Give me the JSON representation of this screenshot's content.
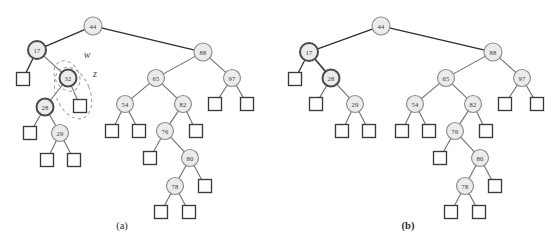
{
  "figure": {
    "background_color": "#ffffff",
    "node_fill": "#eceaea",
    "node_stroke": "#8d8d8d",
    "node_stroke_highlight": "#4a4a4a",
    "leaf_stroke": "#3a3a3a",
    "edge_color": "#6f6f6f",
    "annotation_color": "#9a9a9a"
  },
  "panels": [
    {
      "id": "panel-a",
      "caption": "(a)",
      "caption_bold": false,
      "caption_pos": {
        "x": 122,
        "y": 225
      },
      "origin": {
        "x": 0,
        "y": 0
      },
      "nodes": [
        {
          "id": "a44",
          "label": "44",
          "x": 93,
          "y": 26,
          "r": 9,
          "style": "normal"
        },
        {
          "id": "a17",
          "label": "17",
          "x": 37,
          "y": 50,
          "r": 9,
          "style": "bold"
        },
        {
          "id": "a88",
          "label": "88",
          "x": 203,
          "y": 52,
          "r": 9,
          "style": "normal"
        },
        {
          "id": "a32",
          "label": "32",
          "x": 68,
          "y": 78,
          "r": 8.5,
          "style": "bold"
        },
        {
          "id": "a65",
          "label": "65",
          "x": 156,
          "y": 78,
          "r": 8.5,
          "style": "normal"
        },
        {
          "id": "a97",
          "label": "97",
          "x": 232,
          "y": 78,
          "r": 8.5,
          "style": "normal"
        },
        {
          "id": "a28",
          "label": "28",
          "x": 45,
          "y": 107,
          "r": 8.5,
          "style": "bold"
        },
        {
          "id": "a54",
          "label": "54",
          "x": 125,
          "y": 104,
          "r": 8.5,
          "style": "normal"
        },
        {
          "id": "a82",
          "label": "82",
          "x": 183,
          "y": 104,
          "r": 8.5,
          "style": "normal"
        },
        {
          "id": "a29",
          "label": "29",
          "x": 60,
          "y": 133,
          "r": 8.5,
          "style": "normal"
        },
        {
          "id": "a76",
          "label": "76",
          "x": 165,
          "y": 131,
          "r": 8.5,
          "style": "normal"
        },
        {
          "id": "a80",
          "label": "80",
          "x": 190,
          "y": 158,
          "r": 8.5,
          "style": "normal"
        },
        {
          "id": "a78",
          "label": "78",
          "x": 175,
          "y": 186,
          "r": 8.5,
          "style": "normal"
        }
      ],
      "leaves": [
        {
          "id": "aL1",
          "x": 23,
          "y": 79,
          "s": 13,
          "parent": "a17"
        },
        {
          "id": "aL2",
          "x": 80,
          "y": 106,
          "s": 13,
          "parent": "a32"
        },
        {
          "id": "aL3",
          "x": 215,
          "y": 104,
          "s": 13,
          "parent": "a97"
        },
        {
          "id": "aL4",
          "x": 247,
          "y": 104,
          "s": 13,
          "parent": "a97"
        },
        {
          "id": "aL5",
          "x": 30,
          "y": 133,
          "s": 13,
          "parent": "a28"
        },
        {
          "id": "aL6",
          "x": 112,
          "y": 131,
          "s": 13,
          "parent": "a54"
        },
        {
          "id": "aL7",
          "x": 139,
          "y": 131,
          "s": 13,
          "parent": "a54"
        },
        {
          "id": "aL8",
          "x": 196,
          "y": 131,
          "s": 13,
          "parent": "a82"
        },
        {
          "id": "aL9",
          "x": 47,
          "y": 160,
          "s": 13,
          "parent": "a29"
        },
        {
          "id": "aL10",
          "x": 74,
          "y": 160,
          "s": 13,
          "parent": "a29"
        },
        {
          "id": "aL11",
          "x": 150,
          "y": 158,
          "s": 13,
          "parent": "a76"
        },
        {
          "id": "aL12",
          "x": 205,
          "y": 186,
          "s": 13,
          "parent": "a80"
        },
        {
          "id": "aL13",
          "x": 161,
          "y": 212,
          "s": 13,
          "parent": "a78"
        },
        {
          "id": "aL14",
          "x": 189,
          "y": 212,
          "s": 13,
          "parent": "a78"
        }
      ],
      "edges": [
        {
          "from": "a44",
          "to": "a17",
          "style": "dark"
        },
        {
          "from": "a44",
          "to": "a88",
          "style": "dark"
        },
        {
          "from": "a17",
          "to": "aL1",
          "style": "dark"
        },
        {
          "from": "a17",
          "to": "a32",
          "style": "normal"
        },
        {
          "from": "a32",
          "to": "a28",
          "style": "normal"
        },
        {
          "from": "a32",
          "to": "aL2",
          "style": "normal"
        },
        {
          "from": "a28",
          "to": "aL5",
          "style": "normal"
        },
        {
          "from": "a28",
          "to": "a29",
          "style": "normal"
        },
        {
          "from": "a29",
          "to": "aL9",
          "style": "normal"
        },
        {
          "from": "a29",
          "to": "aL10",
          "style": "normal"
        },
        {
          "from": "a88",
          "to": "a65",
          "style": "normal"
        },
        {
          "from": "a88",
          "to": "a97",
          "style": "normal"
        },
        {
          "from": "a97",
          "to": "aL3",
          "style": "normal"
        },
        {
          "from": "a97",
          "to": "aL4",
          "style": "normal"
        },
        {
          "from": "a65",
          "to": "a54",
          "style": "normal"
        },
        {
          "from": "a65",
          "to": "a82",
          "style": "normal"
        },
        {
          "from": "a54",
          "to": "aL6",
          "style": "normal"
        },
        {
          "from": "a54",
          "to": "aL7",
          "style": "normal"
        },
        {
          "from": "a82",
          "to": "a76",
          "style": "normal"
        },
        {
          "from": "a82",
          "to": "aL8",
          "style": "normal"
        },
        {
          "from": "a76",
          "to": "aL11",
          "style": "normal"
        },
        {
          "from": "a76",
          "to": "a80",
          "style": "normal"
        },
        {
          "from": "a80",
          "to": "a78",
          "style": "normal"
        },
        {
          "from": "a80",
          "to": "aL12",
          "style": "normal"
        },
        {
          "from": "a78",
          "to": "aL13",
          "style": "normal"
        },
        {
          "from": "a78",
          "to": "aL14",
          "style": "normal"
        }
      ],
      "annotations": [
        {
          "id": "annot-w",
          "label": "w",
          "label_pos": {
            "x": 87,
            "y": 54
          },
          "ellipse": {
            "cx": 67,
            "cy": 76,
            "rx": 12,
            "ry": 16,
            "rotate": -28
          }
        },
        {
          "id": "annot-z",
          "label": "z",
          "label_pos": {
            "x": 95,
            "y": 73
          },
          "ellipse": {
            "cx": 73,
            "cy": 93,
            "rx": 17,
            "ry": 27,
            "rotate": -22
          }
        }
      ]
    },
    {
      "id": "panel-b",
      "caption": "(b)",
      "caption_bold": true,
      "caption_pos": {
        "x": 408,
        "y": 225
      },
      "origin": {
        "x": 278,
        "y": 0
      },
      "nodes": [
        {
          "id": "b44",
          "label": "44",
          "x": 381,
          "y": 26,
          "r": 9,
          "style": "normal"
        },
        {
          "id": "b17",
          "label": "17",
          "x": 309,
          "y": 52,
          "r": 9,
          "style": "bold"
        },
        {
          "id": "b88",
          "label": "88",
          "x": 493,
          "y": 52,
          "r": 9,
          "style": "normal"
        },
        {
          "id": "b28",
          "label": "28",
          "x": 331,
          "y": 78,
          "r": 8.5,
          "style": "bold"
        },
        {
          "id": "b65",
          "label": "65",
          "x": 446,
          "y": 78,
          "r": 8.5,
          "style": "normal"
        },
        {
          "id": "b97",
          "label": "97",
          "x": 522,
          "y": 78,
          "r": 8.5,
          "style": "normal"
        },
        {
          "id": "b29",
          "label": "29",
          "x": 355,
          "y": 104,
          "r": 8.5,
          "style": "normal"
        },
        {
          "id": "b54",
          "label": "54",
          "x": 415,
          "y": 104,
          "r": 8.5,
          "style": "normal"
        },
        {
          "id": "b82",
          "label": "82",
          "x": 473,
          "y": 104,
          "r": 8.5,
          "style": "normal"
        },
        {
          "id": "b76",
          "label": "76",
          "x": 455,
          "y": 131,
          "r": 8.5,
          "style": "normal"
        },
        {
          "id": "b80",
          "label": "80",
          "x": 480,
          "y": 158,
          "r": 8.5,
          "style": "normal"
        },
        {
          "id": "b78",
          "label": "78",
          "x": 465,
          "y": 186,
          "r": 8.5,
          "style": "normal"
        }
      ],
      "leaves": [
        {
          "id": "bL1",
          "x": 295,
          "y": 79,
          "s": 13,
          "parent": "b17"
        },
        {
          "id": "bL2",
          "x": 316,
          "y": 104,
          "s": 13,
          "parent": "b28"
        },
        {
          "id": "bL3",
          "x": 505,
          "y": 104,
          "s": 13,
          "parent": "b97"
        },
        {
          "id": "bL4",
          "x": 537,
          "y": 104,
          "s": 13,
          "parent": "b97"
        },
        {
          "id": "bL5",
          "x": 342,
          "y": 131,
          "s": 13,
          "parent": "b29"
        },
        {
          "id": "bL6",
          "x": 369,
          "y": 131,
          "s": 13,
          "parent": "b29"
        },
        {
          "id": "bL7",
          "x": 402,
          "y": 131,
          "s": 13,
          "parent": "b54"
        },
        {
          "id": "bL8",
          "x": 429,
          "y": 131,
          "s": 13,
          "parent": "b54"
        },
        {
          "id": "bL9",
          "x": 486,
          "y": 131,
          "s": 13,
          "parent": "b82"
        },
        {
          "id": "bL10",
          "x": 440,
          "y": 158,
          "s": 13,
          "parent": "b76"
        },
        {
          "id": "bL11",
          "x": 495,
          "y": 186,
          "s": 13,
          "parent": "b80"
        },
        {
          "id": "bL12",
          "x": 451,
          "y": 212,
          "s": 13,
          "parent": "b78"
        },
        {
          "id": "bL13",
          "x": 479,
          "y": 212,
          "s": 13,
          "parent": "b78"
        }
      ],
      "edges": [
        {
          "from": "b44",
          "to": "b17",
          "style": "dark"
        },
        {
          "from": "b44",
          "to": "b88",
          "style": "dark"
        },
        {
          "from": "b17",
          "to": "bL1",
          "style": "dark"
        },
        {
          "from": "b17",
          "to": "b28",
          "style": "bold"
        },
        {
          "from": "b28",
          "to": "bL2",
          "style": "normal"
        },
        {
          "from": "b28",
          "to": "b29",
          "style": "normal"
        },
        {
          "from": "b29",
          "to": "bL5",
          "style": "normal"
        },
        {
          "from": "b29",
          "to": "bL6",
          "style": "normal"
        },
        {
          "from": "b88",
          "to": "b65",
          "style": "normal"
        },
        {
          "from": "b88",
          "to": "b97",
          "style": "normal"
        },
        {
          "from": "b97",
          "to": "bL3",
          "style": "normal"
        },
        {
          "from": "b97",
          "to": "bL4",
          "style": "normal"
        },
        {
          "from": "b65",
          "to": "b54",
          "style": "normal"
        },
        {
          "from": "b65",
          "to": "b82",
          "style": "normal"
        },
        {
          "from": "b54",
          "to": "bL7",
          "style": "normal"
        },
        {
          "from": "b54",
          "to": "bL8",
          "style": "normal"
        },
        {
          "from": "b82",
          "to": "b76",
          "style": "normal"
        },
        {
          "from": "b82",
          "to": "bL9",
          "style": "normal"
        },
        {
          "from": "b76",
          "to": "bL10",
          "style": "normal"
        },
        {
          "from": "b76",
          "to": "b80",
          "style": "normal"
        },
        {
          "from": "b80",
          "to": "b78",
          "style": "normal"
        },
        {
          "from": "b80",
          "to": "bL11",
          "style": "normal"
        },
        {
          "from": "b78",
          "to": "bL12",
          "style": "normal"
        },
        {
          "from": "b78",
          "to": "bL13",
          "style": "normal"
        }
      ],
      "annotations": []
    }
  ]
}
